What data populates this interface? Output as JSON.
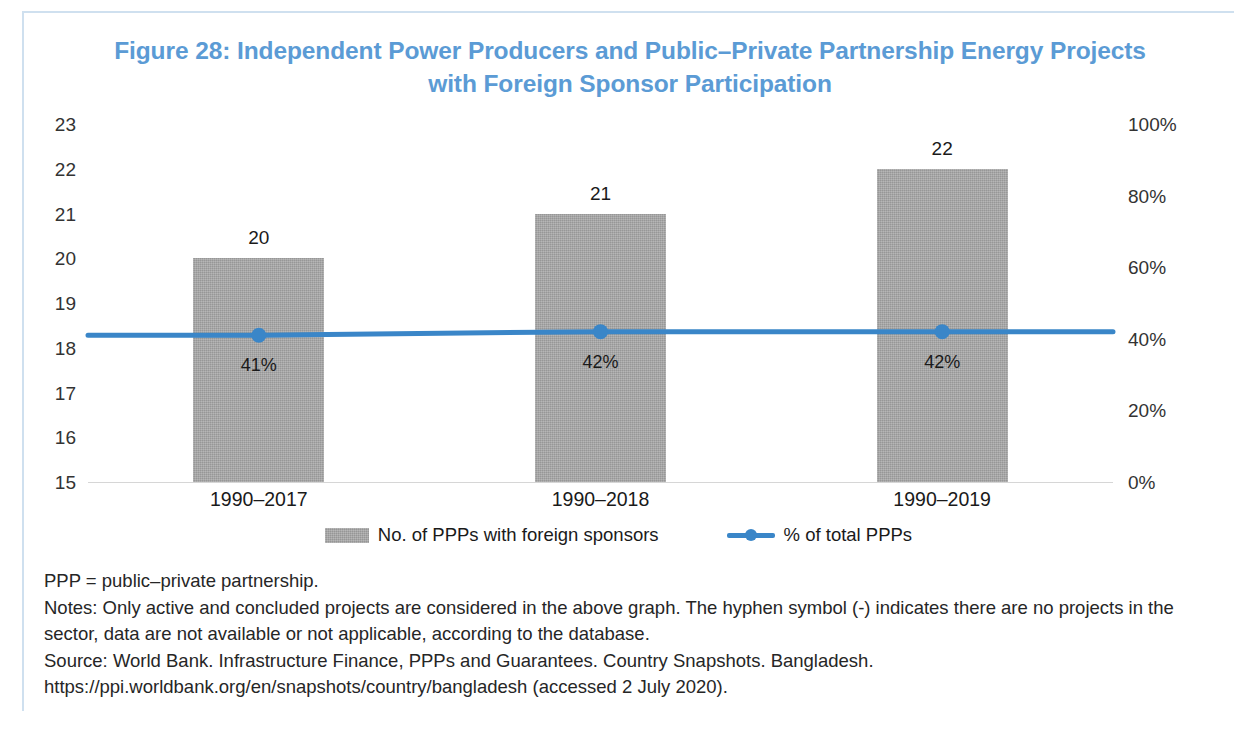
{
  "figure": {
    "title": "Figure 28: Independent Power Producers and Public–Private Partnership Energy Projects with Foreign Sponsor Participation",
    "title_line1": "Figure 28: Independent Power Producers and Public–Private Partnership Energy Projects",
    "title_line2": "with Foreign Sponsor Participation",
    "title_color": "#5b9bd5",
    "frame_color": "#cfe0ef"
  },
  "chart_data": {
    "type": "bar",
    "title": "Figure 28: Independent Power Producers and Public–Private Partnership Energy Projects with Foreign Sponsor Participation",
    "xlabel": "",
    "ylabel": "",
    "categories": [
      "1990–2017",
      "1990–2018",
      "1990–2019"
    ],
    "grid": false,
    "legend_position": "bottom",
    "series": [
      {
        "name": "No. of PPPs with foreign sponsors",
        "type": "bar",
        "axis": "left",
        "color": "#a6a6a6",
        "values": [
          20,
          21,
          22
        ],
        "labels": [
          "20",
          "21",
          "22"
        ]
      },
      {
        "name": "% of total PPPs",
        "type": "line",
        "axis": "right",
        "color": "#3a86c8",
        "values": [
          41,
          42,
          42
        ],
        "labels": [
          "41%",
          "42%",
          "42%"
        ]
      }
    ],
    "left_axis": {
      "ticks": [
        23,
        22,
        21,
        20,
        19,
        18,
        17,
        16,
        15
      ],
      "tick_labels": [
        "23",
        "22",
        "21",
        "20",
        "19",
        "18",
        "17",
        "16",
        "15"
      ],
      "ylim": [
        15,
        23
      ]
    },
    "right_axis": {
      "ticks": [
        100,
        80,
        60,
        40,
        20,
        0
      ],
      "tick_labels": [
        "100%",
        "80%",
        "60%",
        "40%",
        "20%",
        "0%"
      ],
      "ylim": [
        0,
        100
      ]
    }
  },
  "legend": {
    "items": [
      {
        "label": "No. of PPPs with foreign sponsors",
        "marker": "bar-swatch"
      },
      {
        "label": "% of total PPPs",
        "marker": "line-swatch"
      }
    ]
  },
  "notes": {
    "abbreviation": "PPP = public–private partnership.",
    "note_line": "Notes: Only active and concluded projects are considered in the above graph. The hyphen symbol (-) indicates there are no projects in the sector, data are not available or not applicable, according to the database.",
    "source_line": "Source: World Bank. Infrastructure Finance, PPPs and Guarantees. Country Snapshots. Bangladesh. https://ppi.worldbank.org/en/snapshots/country/bangladesh (accessed 2 July 2020)."
  }
}
